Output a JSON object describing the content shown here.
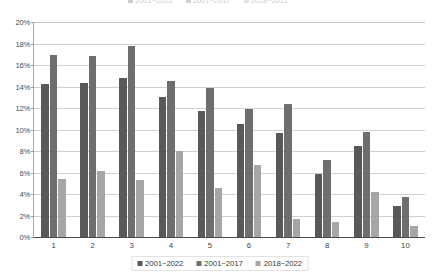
{
  "chart_data": {
    "type": "bar",
    "title": "",
    "subtitle": "",
    "xlabel": "",
    "ylabel": "",
    "categories": [
      "1",
      "2",
      "3",
      "4",
      "5",
      "6",
      "7",
      "8",
      "9",
      "10"
    ],
    "ylim": [
      0,
      20
    ],
    "ytick_labels": [
      "0%",
      "2%",
      "4%",
      "6%",
      "8%",
      "10%",
      "12%",
      "14%",
      "16%",
      "18%",
      "20%"
    ],
    "ytick_values": [
      0,
      2,
      4,
      6,
      8,
      10,
      12,
      14,
      16,
      18,
      20
    ],
    "grid": true,
    "legend_position": "bottom",
    "value_unit": "%",
    "series": [
      {
        "name": "2001~2022",
        "color": "#595959",
        "values": [
          14.2,
          14.3,
          14.8,
          13.0,
          11.7,
          10.5,
          9.7,
          5.9,
          8.5,
          2.9
        ]
      },
      {
        "name": "2001~2017",
        "color": "#6e6e6e",
        "values": [
          16.9,
          16.8,
          17.8,
          14.5,
          13.9,
          11.9,
          12.4,
          7.2,
          9.8,
          3.7
        ]
      },
      {
        "name": "2018~2022",
        "color": "#a6a6a6",
        "values": [
          5.4,
          6.1,
          5.3,
          8.0,
          4.6,
          6.7,
          1.7,
          1.4,
          4.2,
          1.0
        ]
      }
    ]
  },
  "legend": {
    "items": [
      {
        "label": "2001~2022",
        "color": "#595959"
      },
      {
        "label": "2001~2017",
        "color": "#6e6e6e"
      },
      {
        "label": "2018~2022",
        "color": "#a6a6a6"
      }
    ]
  },
  "top_clipped_legend": {
    "items": [
      {
        "label": "2001~2022",
        "color": "#595959"
      },
      {
        "label": "2001~2017",
        "color": "#6e6e6e"
      },
      {
        "label": "2018~2022",
        "color": "#a6a6a6"
      }
    ]
  }
}
